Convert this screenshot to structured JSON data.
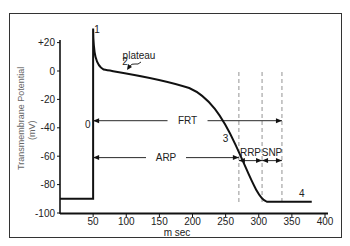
{
  "chart_data": {
    "type": "line",
    "title": "",
    "xlabel": "m sec",
    "ylabel": "Transmembrane Potential (mV)",
    "ylabel_line1": "Transmembrane  Potential",
    "ylabel_line2": "(mV)",
    "xlim": [
      0,
      400
    ],
    "ylim": [
      -100,
      20
    ],
    "grid": false,
    "x_ticks": [
      "50",
      "100",
      "150",
      "200",
      "250",
      "300",
      "350",
      "400"
    ],
    "y_ticks": [
      "+20",
      "0",
      "-20",
      "-40",
      "-60",
      "-80",
      "-100"
    ],
    "series": [
      {
        "name": "Action potential",
        "x": [
          0,
          50,
          50,
          51,
          55,
          65,
          80,
          100,
          150,
          200,
          230,
          250,
          270,
          290,
          310,
          320,
          330,
          340,
          400
        ],
        "y": [
          -90,
          -90,
          30,
          15,
          5,
          1,
          0,
          -2,
          -6,
          -14,
          -24,
          -38,
          -58,
          -78,
          -90,
          -92,
          -92,
          -92,
          -92
        ]
      }
    ],
    "phase_labels": [
      {
        "label": "0",
        "x": 42,
        "y": -40
      },
      {
        "label": "1",
        "x": 56,
        "y": 27
      },
      {
        "label": "2",
        "x": 98,
        "y": 4
      },
      {
        "label": "3",
        "x": 250,
        "y": -50
      },
      {
        "label": "4",
        "x": 365,
        "y": -89
      }
    ],
    "annotations": [
      {
        "label": "plateau",
        "x": 115,
        "y": 6,
        "arrow_to": [
          112,
          2
        ]
      },
      {
        "label": "FRT",
        "from": 50,
        "to": 335,
        "y": -35,
        "meaning": "full recovery time"
      },
      {
        "label": "ARP",
        "from": 50,
        "to": 270,
        "y": -61,
        "meaning": "absolute refractory period"
      },
      {
        "label": "RRP",
        "from": 270,
        "to": 305,
        "y": -61,
        "meaning": "relative refractory period"
      },
      {
        "label": "SNP",
        "from": 305,
        "to": 335,
        "y": -61,
        "meaning": "supernormal period"
      }
    ],
    "dashed_vertical_lines_x": [
      270,
      305,
      335
    ]
  }
}
